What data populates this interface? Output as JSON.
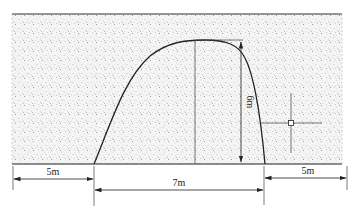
{
  "diagram": {
    "type": "tunnel cross-section in soil",
    "colors": {
      "soil_fill": "#f4f4f4",
      "soil_dots": "#8a8a8a",
      "line": "#222222"
    },
    "dimensions": {
      "left_clearance": "5m",
      "span": "7m",
      "right_clearance": "5m",
      "height": "6m"
    }
  }
}
